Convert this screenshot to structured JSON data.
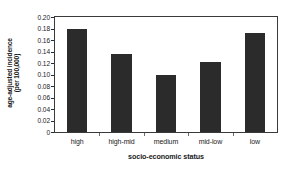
{
  "chart_data": {
    "type": "bar",
    "title": "",
    "categories": [
      "high",
      "high-mid",
      "medium",
      "mid-low",
      "low"
    ],
    "values": [
      0.18,
      0.136,
      0.1,
      0.121,
      0.172
    ],
    "xlabel": "socio-economic status",
    "ylabel": "age-adjusted incidence (per 100,000)",
    "ylabel_lines": [
      "age-adjusted incidence",
      "(per 100,000)"
    ],
    "ylim": [
      0,
      0.2
    ],
    "ytick_values": [
      0,
      0.02,
      0.04,
      0.06,
      0.08,
      0.1,
      0.12,
      0.14,
      0.16,
      0.18,
      0.2
    ],
    "ytick_labels": [
      "0",
      "0.02",
      "0.04",
      "0.06",
      "0.08",
      "0.10",
      "0.12",
      "0.14",
      "0.16",
      "0.18",
      "0.20"
    ],
    "grid": false,
    "legend": false,
    "bar_color": "#2b2b2b",
    "frame_color": "#3a3a3a",
    "background": "#ffffff"
  }
}
